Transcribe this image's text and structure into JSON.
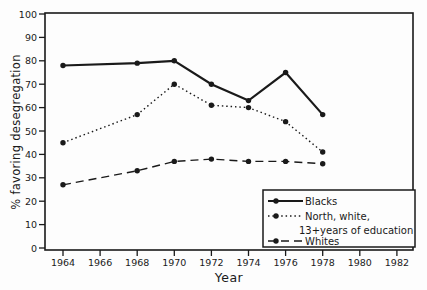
{
  "chart_data": {
    "type": "line",
    "title": "",
    "xlabel": "Year",
    "ylabel": "% favoring desegregation",
    "xlim": [
      1963,
      1983
    ],
    "ylim": [
      0,
      100
    ],
    "grid": false,
    "legend_position": "lower right",
    "x_ticks": [
      1964,
      1966,
      1968,
      1970,
      1972,
      1974,
      1976,
      1978,
      1980,
      1982
    ],
    "y_ticks": [
      0,
      10,
      20,
      30,
      40,
      50,
      60,
      70,
      80,
      90,
      100
    ],
    "x": [
      1964,
      1968,
      1970,
      1972,
      1974,
      1976,
      1978
    ],
    "series": [
      {
        "name": "Blacks",
        "legend_lines": [
          "Blacks"
        ],
        "line_style": "solid",
        "marker": "filled-circle",
        "values": [
          78,
          79,
          80,
          70,
          63,
          75,
          57
        ]
      },
      {
        "name": "North, white, 13+years of education",
        "legend_lines": [
          "North, white,",
          "13+years of education"
        ],
        "line_style": "dotted",
        "marker": "filled-circle",
        "values": [
          45,
          57,
          70,
          61,
          60,
          54,
          41
        ]
      },
      {
        "name": "Whites",
        "legend_lines": [
          "Whites"
        ],
        "line_style": "dashed",
        "marker": "filled-circle",
        "values": [
          27,
          33,
          37,
          38,
          37,
          37,
          36
        ]
      }
    ],
    "colors": {
      "ink": "#1a1a1a",
      "background": "#fdfdfd"
    }
  }
}
